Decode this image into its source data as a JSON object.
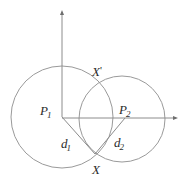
{
  "figure": {
    "kind": "geometry-diagram",
    "background_color": "#ffffff",
    "stroke_color": "#8c8c8c",
    "axis_color": "#8c8c8c",
    "label_color": "#2b2b2b"
  },
  "labels": {
    "p1": {
      "main": "P",
      "sub": "1"
    },
    "p2": {
      "main": "P",
      "sub": "2"
    },
    "d1": {
      "main": "d",
      "sub": "1"
    },
    "d2": {
      "main": "d",
      "sub": "2"
    },
    "x_prime": {
      "main": "X",
      "prime": "'"
    },
    "x": {
      "main": "X"
    }
  },
  "geometry": {
    "origin": {
      "x": 62,
      "y": 117
    },
    "circle1": {
      "cx": 62,
      "cy": 117,
      "r": 51
    },
    "circle2": {
      "cx": 122,
      "cy": 119,
      "r": 43
    },
    "intersection_lower": {
      "x": 95,
      "y": 153
    },
    "intersection_upper": {
      "x": 95,
      "y": 84
    },
    "x_axis": {
      "x1": 62,
      "y1": 117,
      "x2": 178,
      "y2": 118
    },
    "y_axis": {
      "x1": 62,
      "y1": 117,
      "x2": 62,
      "y2": 10
    },
    "segment_d1": {
      "x1": 62,
      "y1": 117,
      "x2": 95,
      "y2": 153
    },
    "segment_d2": {
      "x1": 125,
      "y1": 118,
      "x2": 95,
      "y2": 153
    }
  }
}
